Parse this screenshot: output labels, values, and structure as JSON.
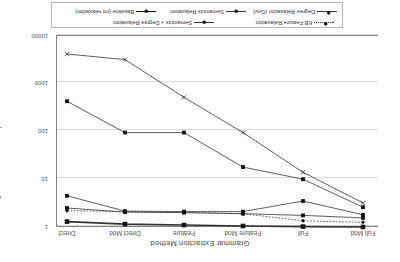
{
  "chart_data": {
    "type": "line",
    "title": "Grammar Extraction Method",
    "xlabel": "Grammar Extraction Method",
    "ylabel": "Avg. Number of Parses per Sentences Parsed",
    "categories": [
      "Full Mod",
      "Full",
      "Feature Mod",
      "Feature",
      "Direct Mod",
      "Direct"
    ],
    "yticks": [
      "1",
      "10",
      "100",
      "1000",
      "10000"
    ],
    "ylim": [
      1,
      10000
    ],
    "yscale": "log",
    "grid": true,
    "legend_position": "bottom",
    "series": [
      {
        "name": "Baseline (no relaxation)",
        "marker": "square",
        "style": "thick-solid",
        "values": [
          1.0,
          1.02,
          1.05,
          1.1,
          1.15,
          1.3
        ]
      },
      {
        "name": "Semantics Relaxation",
        "marker": "square",
        "style": "solid",
        "values": [
          1.55,
          1.75,
          1.9,
          2.0,
          2.05,
          2.5
        ]
      },
      {
        "name": "Semantics + Degree Relaxation",
        "marker": "square",
        "style": "solid",
        "values": [
          1.8,
          3.5,
          2.1,
          2.1,
          2.15,
          4.5
        ]
      },
      {
        "name": "KB Feature Relaxation",
        "marker": "diamond",
        "style": "dotted",
        "values": [
          1.25,
          1.35,
          1.9,
          2.0,
          2.1,
          2.2
        ]
      },
      {
        "name": "Degree Relaxation (Gov)",
        "marker": "square",
        "style": "solid",
        "values": [
          2.6,
          10.0,
          18.0,
          95.0,
          95.0,
          430.0
        ]
      },
      {
        "name": "Degree Relaxation (X)",
        "marker": "x",
        "style": "solid",
        "values": [
          3.2,
          14.0,
          95.0,
          520.0,
          3200.0,
          4200.0
        ]
      }
    ]
  },
  "legend": {
    "rows": [
      [
        {
          "label": "Semantics + Degree Relaxation",
          "marker": "square",
          "style": "solid"
        },
        {
          "label": "KB Feature Relaxation",
          "marker": "diamond",
          "style": "dotted"
        }
      ],
      [
        {
          "label": "Baseline (no relaxation)",
          "marker": "square",
          "style": "thick"
        },
        {
          "label": "Semantics Relaxation",
          "marker": "square",
          "style": "solid"
        },
        {
          "label": "Degree Relaxation (Gov)",
          "marker": "diamond",
          "style": "solid"
        }
      ]
    ]
  },
  "colors": {
    "line": "#333333",
    "grid": "#d9d9d9",
    "axis": "#808080",
    "text": "#555555"
  }
}
